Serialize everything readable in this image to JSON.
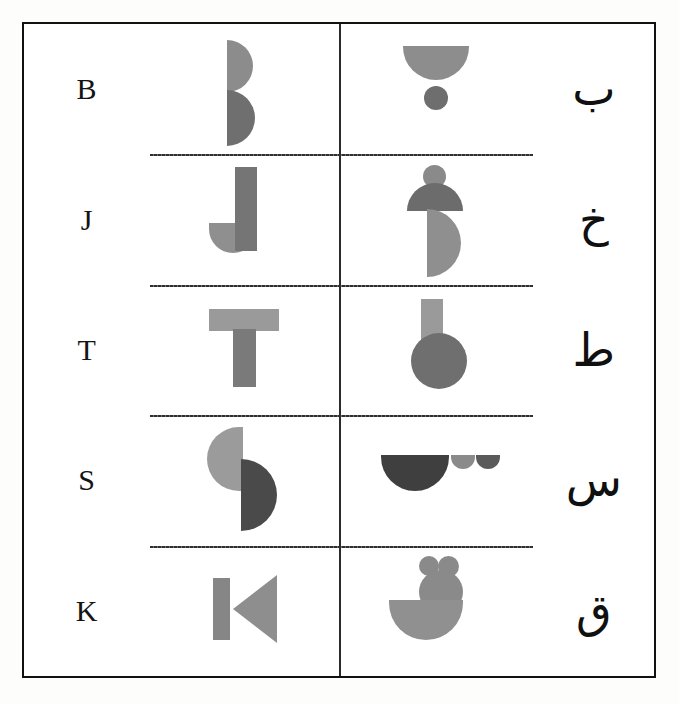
{
  "figure": {
    "type": "letter-correspondence-table",
    "columns": [
      "latin_letter",
      "latin_shape_design",
      "arabic_shape_design",
      "arabic_letter"
    ],
    "rows": [
      {
        "latin": "B",
        "arabic": "ب",
        "latin_shape_name": "two-stacked-right-semicircles",
        "arabic_shape_name": "bottom-semicircle-with-dot-below",
        "latin_shape_colors": [
          "#8c8c8c",
          "#6f6f6f"
        ],
        "arabic_shape_colors": [
          "#8d8d8d",
          "#6e6e6e"
        ]
      },
      {
        "latin": "J",
        "arabic": "خ",
        "latin_shape_name": "vertical-bar-with-bottom-left-hook",
        "arabic_shape_name": "dot-cap-and-right-belly",
        "latin_shape_colors": [
          "#757575",
          "#8f8f8f"
        ],
        "arabic_shape_colors": [
          "#8a8a8a",
          "#6c6c6c",
          "#8f8f8f"
        ]
      },
      {
        "latin": "T",
        "arabic": "ط",
        "latin_shape_name": "horizontal-bar-over-vertical-stem",
        "arabic_shape_name": "vertical-bar-with-overlapping-circle",
        "latin_shape_colors": [
          "#9a9a9a",
          "#7a7a7a"
        ],
        "arabic_shape_colors": [
          "#9a9a9a",
          "#6f6f6f"
        ]
      },
      {
        "latin": "S",
        "arabic": "س",
        "latin_shape_name": "offset-left-and-right-semicircles",
        "arabic_shape_name": "large-bowl-with-two-small-bowls",
        "latin_shape_colors": [
          "#9b9b9b",
          "#4a4a4a"
        ],
        "arabic_shape_colors": [
          "#3f3f3f",
          "#8a8a8a",
          "#5a5a5a"
        ]
      },
      {
        "latin": "K",
        "arabic": "ق",
        "latin_shape_name": "vertical-bar-with-left-pointing-triangle",
        "arabic_shape_name": "two-dots-circle-and-bowl",
        "latin_shape_colors": [
          "#868686",
          "#8e8e8e"
        ],
        "arabic_shape_colors": [
          "#8a8a8a",
          "#8a8a8a",
          "#8a8a8a",
          "#909090"
        ]
      }
    ],
    "border_color": "#111111",
    "divider_color": "#2a2a2a"
  }
}
